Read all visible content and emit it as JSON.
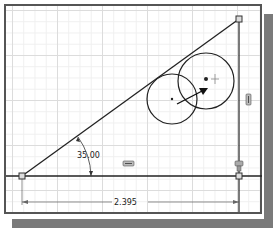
{
  "sketch": {
    "angle_dimension": "35.00",
    "linear_dimension": "2.395",
    "constraints": {
      "horizontal_glyph": "horizontal-constraint-icon",
      "vertical_glyph": "vertical-constraint-icon",
      "fix_glyph": "fix-constraint-icon"
    },
    "colors": {
      "geometry": "#222222",
      "grid_major": "#dcdcdc",
      "grid_minor": "#efefef",
      "frame": "#555555",
      "shadow": "#7a7a7a"
    }
  }
}
